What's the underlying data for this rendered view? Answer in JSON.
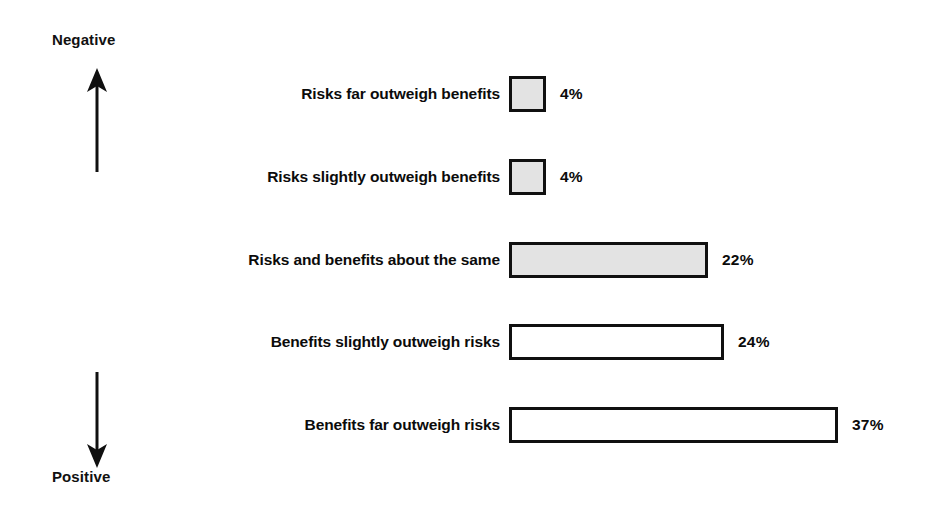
{
  "chart_data": {
    "type": "bar",
    "orientation": "horizontal",
    "title": "",
    "subtitle": "",
    "xlabel": "",
    "ylabel": "",
    "grid": false,
    "legend": "none",
    "xlim": [
      0,
      40
    ],
    "axis_annotations": {
      "top_label": "Negative",
      "top_arrow": "arrow-up",
      "bottom_label": "Positive",
      "bottom_arrow": "arrow-down"
    },
    "categories": [
      "Risks far outweigh benefits",
      "Risks slightly outweigh benefits",
      "Risks and benefits about the same",
      "Benefits slightly outweigh risks",
      "Benefits far outweigh risks"
    ],
    "values": [
      4,
      4,
      22,
      24,
      37
    ],
    "value_labels": [
      "4%",
      "4%",
      "22%",
      "24%",
      "37%"
    ],
    "bar_fills": [
      "#e3e3e3",
      "#e3e3e3",
      "#e3e3e3",
      "#ffffff",
      "#ffffff"
    ],
    "bar_border_color": "#101010",
    "bars": [
      {
        "label": "Risks far outweigh benefits",
        "value": 4,
        "value_label": "4%",
        "width_px": 37,
        "fill": "#e3e3e3",
        "filled": true
      },
      {
        "label": "Risks slightly outweigh benefits",
        "value": 4,
        "value_label": "4%",
        "width_px": 37,
        "fill": "#e3e3e3",
        "filled": true
      },
      {
        "label": "Risks and benefits about the same",
        "value": 22,
        "value_label": "22%",
        "width_px": 199,
        "fill": "#e3e3e3",
        "filled": true
      },
      {
        "label": "Benefits slightly outweigh risks",
        "value": 24,
        "value_label": "24%",
        "width_px": 215,
        "fill": "#ffffff",
        "filled": false
      },
      {
        "label": "Benefits far outweigh risks",
        "value": 37,
        "value_label": "37%",
        "width_px": 329,
        "fill": "#ffffff",
        "filled": false
      }
    ]
  }
}
